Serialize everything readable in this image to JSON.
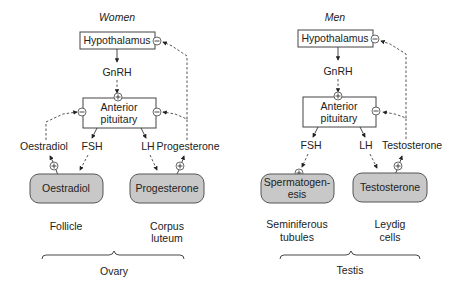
{
  "women": {
    "title": "Women",
    "hypothalamus": "Hypothalamus",
    "gnrh": "GnRH",
    "pituitary_line1": "Anterior",
    "pituitary_line2": "pituitary",
    "fsh": "FSH",
    "lh": "LH",
    "oestradiol_label": "Oestradiol",
    "progesterone_label": "Progesterone",
    "box_left": "Oestradiol",
    "box_right": "Progesterone",
    "site_left": "Follicle",
    "site_right_line1": "Corpus",
    "site_right_line2": "luteum",
    "organ": "Ovary"
  },
  "men": {
    "title": "Men",
    "hypothalamus": "Hypothalamus",
    "gnrh": "GnRH",
    "pituitary_line1": "Anterior",
    "pituitary_line2": "pituitary",
    "fsh": "FSH",
    "lh": "LH",
    "testosterone_label": "Testosterone",
    "box_left_line1": "Spermatogen-",
    "box_left_line2": "esis",
    "box_right": "Testosterone",
    "site_left_line1": "Seminiferous",
    "site_left_line2": "tubules",
    "site_right_line1": "Leydig",
    "site_right_line2": "cells",
    "organ": "Testis"
  },
  "signs": {
    "plus": "+",
    "minus": "−"
  }
}
